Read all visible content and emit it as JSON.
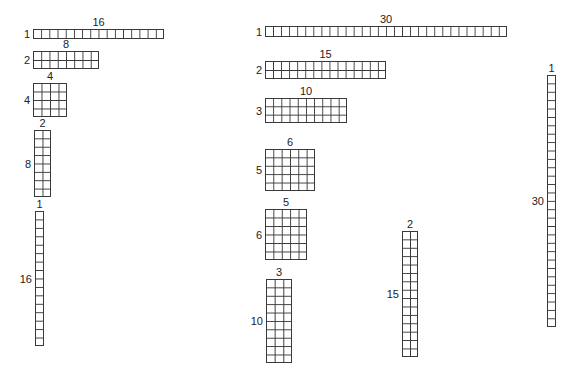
{
  "diagram": {
    "title": "",
    "grid_line_color": "#3a3a3a",
    "groups": [
      {
        "name": "factors-of-16",
        "arrays": [
          {
            "rows": 1,
            "cols": 16,
            "row_label": "1",
            "col_label": "16",
            "x": 33,
            "y": 29,
            "w": 131,
            "h": 10
          },
          {
            "rows": 2,
            "cols": 8,
            "row_label": "2",
            "col_label": "8",
            "x": 33,
            "y": 51,
            "w": 66,
            "h": 18
          },
          {
            "rows": 4,
            "cols": 4,
            "row_label": "4",
            "col_label": "4",
            "x": 33,
            "y": 83,
            "w": 34,
            "h": 34
          },
          {
            "rows": 8,
            "cols": 2,
            "row_label": "8",
            "col_label": "2",
            "x": 34,
            "y": 130,
            "w": 17,
            "h": 67
          },
          {
            "rows": 16,
            "cols": 1,
            "row_label": "16",
            "col_label": "1",
            "x": 35,
            "y": 211,
            "w": 9,
            "h": 135
          }
        ]
      },
      {
        "name": "factors-of-30",
        "arrays": [
          {
            "rows": 1,
            "cols": 30,
            "row_label": "1",
            "col_label": "30",
            "x": 265,
            "y": 26,
            "w": 242,
            "h": 11
          },
          {
            "rows": 2,
            "cols": 15,
            "row_label": "2",
            "col_label": "15",
            "x": 265,
            "y": 61,
            "w": 121,
            "h": 18
          },
          {
            "rows": 3,
            "cols": 10,
            "row_label": "3",
            "col_label": "10",
            "x": 265,
            "y": 98,
            "w": 82,
            "h": 25
          },
          {
            "rows": 5,
            "cols": 6,
            "row_label": "5",
            "col_label": "6",
            "x": 265,
            "y": 149,
            "w": 50,
            "h": 42
          },
          {
            "rows": 6,
            "cols": 5,
            "row_label": "6",
            "col_label": "5",
            "x": 265,
            "y": 209,
            "w": 42,
            "h": 51
          },
          {
            "rows": 10,
            "cols": 3,
            "row_label": "10",
            "col_label": "3",
            "x": 266,
            "y": 279,
            "w": 26,
            "h": 84
          },
          {
            "rows": 15,
            "cols": 2,
            "row_label": "15",
            "col_label": "2",
            "x": 402,
            "y": 231,
            "w": 16,
            "h": 126
          },
          {
            "rows": 30,
            "cols": 1,
            "row_label": "30",
            "col_label": "1",
            "x": 547,
            "y": 75,
            "w": 9,
            "h": 252
          }
        ]
      }
    ]
  }
}
